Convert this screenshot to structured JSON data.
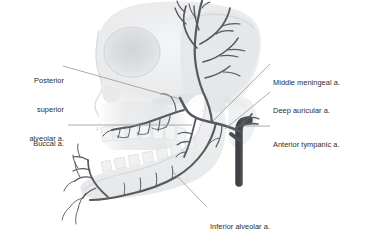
{
  "figure": {
    "type": "anatomical-illustration",
    "background_color": "#ffffff",
    "skull_color": "#d8dadc",
    "artery_color": "#56595d",
    "artery_trunk_color": "#4a4d51",
    "leader_line_color": "#9a9c9e",
    "label_color": "#2b2b2b"
  },
  "labels": [
    {
      "id": "posterior-superior-alveolar",
      "lines": [
        "Posterior",
        "superior",
        "alveolar a."
      ],
      "text": "Posterior superior alveolar a.",
      "side": "left"
    },
    {
      "id": "buccal",
      "lines": [
        "Buccal a."
      ],
      "text": "Buccal a.",
      "side": "left"
    },
    {
      "id": "middle-meningeal",
      "lines": [
        "Middle meningeal a."
      ],
      "text": "Middle meningeal a.",
      "side": "right"
    },
    {
      "id": "deep-auricular",
      "lines": [
        "Deep auricular a."
      ],
      "text": "Deep auricular a.",
      "side": "right"
    },
    {
      "id": "anterior-tympanic",
      "lines": [
        "Anterior tympanic a."
      ],
      "text": "Anterior tympanic a.",
      "side": "right"
    },
    {
      "id": "inferior-alveolar",
      "lines": [
        "Inferior alveolar a."
      ],
      "text": "Inferior alveolar a.",
      "side": "bottom"
    }
  ],
  "label_text": {
    "posterior_superior_alveolar_l1": "Posterior",
    "posterior_superior_alveolar_l2": "superior",
    "posterior_superior_alveolar_l3": "alveolar a.",
    "buccal": "Buccal a.",
    "middle_meningeal": "Middle meningeal a.",
    "deep_auricular": "Deep auricular a.",
    "anterior_tympanic": "Anterior tympanic a.",
    "inferior_alveolar": "Inferior alveolar a."
  }
}
